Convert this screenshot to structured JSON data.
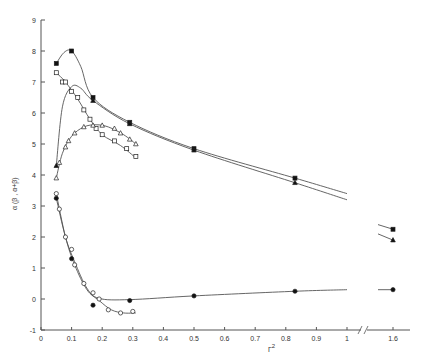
{
  "chart_data": {
    "type": "scatter",
    "title": "",
    "xlabel": "Γ²",
    "ylabel": "α (β , α+β)",
    "xlim": [
      0,
      1.6
    ],
    "ylim": [
      -1,
      9
    ],
    "x_break": {
      "after": 1.0,
      "before": 1.6
    },
    "x_ticks": [
      "0",
      "0.1",
      "0.2",
      "0.3",
      "0.4",
      "0.5",
      "0.6",
      "0.7",
      "0.8",
      "0.9",
      "1",
      "1.6"
    ],
    "y_ticks": [
      "-1",
      "0",
      "1",
      "2",
      "3",
      "4",
      "5",
      "6",
      "7",
      "8",
      "9"
    ],
    "grid": false,
    "legend": "none",
    "series": [
      {
        "name": "filled squares",
        "marker": "square-filled",
        "x": [
          0.05,
          0.1,
          0.17,
          0.29,
          0.5,
          0.83,
          1.6
        ],
        "y": [
          7.6,
          8.0,
          6.5,
          5.7,
          4.85,
          3.9,
          2.25
        ]
      },
      {
        "name": "filled triangles",
        "marker": "triangle-filled",
        "x": [
          0.05,
          0.17,
          0.29,
          0.5,
          0.83,
          1.6
        ],
        "y": [
          4.3,
          6.4,
          5.65,
          4.8,
          3.75,
          1.9
        ]
      },
      {
        "name": "open squares",
        "marker": "square-open",
        "x": [
          0.05,
          0.07,
          0.08,
          0.1,
          0.12,
          0.14,
          0.16,
          0.18,
          0.2,
          0.24,
          0.28,
          0.31
        ],
        "y": [
          7.3,
          7.0,
          7.0,
          6.7,
          6.5,
          6.1,
          5.8,
          5.5,
          5.3,
          5.1,
          4.85,
          4.6
        ]
      },
      {
        "name": "open triangles",
        "marker": "triangle-open",
        "x": [
          0.05,
          0.06,
          0.08,
          0.09,
          0.11,
          0.14,
          0.17,
          0.2,
          0.24,
          0.26,
          0.29,
          0.31
        ],
        "y": [
          3.9,
          4.4,
          4.9,
          5.1,
          5.35,
          5.55,
          5.6,
          5.6,
          5.5,
          5.35,
          5.15,
          5.0
        ]
      },
      {
        "name": "open circles",
        "marker": "circle-open",
        "x": [
          0.05,
          0.06,
          0.08,
          0.1,
          0.11,
          0.14,
          0.17,
          0.19,
          0.22,
          0.26,
          0.3
        ],
        "y": [
          3.4,
          2.9,
          2.0,
          1.6,
          1.1,
          0.5,
          0.2,
          0.0,
          -0.35,
          -0.45,
          -0.4
        ]
      },
      {
        "name": "filled circles",
        "marker": "circle-filled",
        "x": [
          0.05,
          0.1,
          0.17,
          0.29,
          0.5,
          0.83,
          1.6
        ],
        "y": [
          3.25,
          1.3,
          -0.2,
          -0.05,
          0.1,
          0.25,
          0.3
        ]
      }
    ]
  }
}
